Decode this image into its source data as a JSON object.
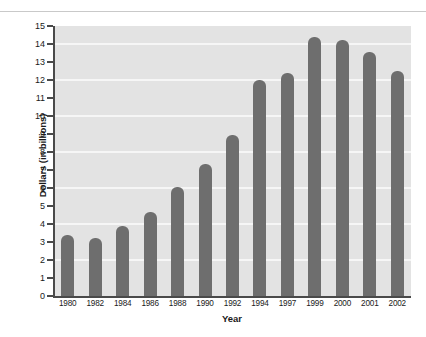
{
  "chart_data": {
    "type": "bar",
    "title": "",
    "subtitle": "",
    "xlabel": "Year",
    "ylabel": "Dollars (in billions)",
    "categories": [
      "1980",
      "1982",
      "1984",
      "1986",
      "1988",
      "1990",
      "1992",
      "1994",
      "1997",
      "1999",
      "2000",
      "2001",
      "2002"
    ],
    "values": [
      3.4,
      3.2,
      3.9,
      4.65,
      6.05,
      7.35,
      8.95,
      12.0,
      12.4,
      14.4,
      14.2,
      13.55,
      12.5
    ],
    "ylim": [
      0,
      15
    ],
    "ytick_step": 1,
    "yticks": [
      0,
      1,
      2,
      3,
      4,
      5,
      6,
      7,
      8,
      9,
      10,
      11,
      12,
      13,
      14,
      15
    ],
    "ytick_labels": [
      "0",
      "1",
      "2",
      "3",
      "4",
      "5",
      "6",
      "7",
      "8",
      "9",
      "10",
      "11",
      "12",
      "13",
      "14",
      "15"
    ],
    "gridlines_at": [
      2,
      4,
      6,
      8,
      10,
      12,
      14
    ],
    "grid": true,
    "legend": null,
    "legend_position": "none",
    "series": [
      {
        "name": "Dollars (in billions)",
        "values": [
          3.4,
          3.2,
          3.9,
          4.65,
          6.05,
          7.35,
          8.95,
          12.0,
          12.4,
          14.4,
          14.2,
          13.55,
          12.5
        ]
      }
    ],
    "colors": {
      "bar": "#6e6e6e",
      "plot_background": "#e3e3e3",
      "gridline": "#f6f6f6",
      "axis": "#4a4a4a",
      "text": "#1a1a1a",
      "page_background": "#ffffff",
      "top_rule": "#c9c9c9"
    }
  }
}
